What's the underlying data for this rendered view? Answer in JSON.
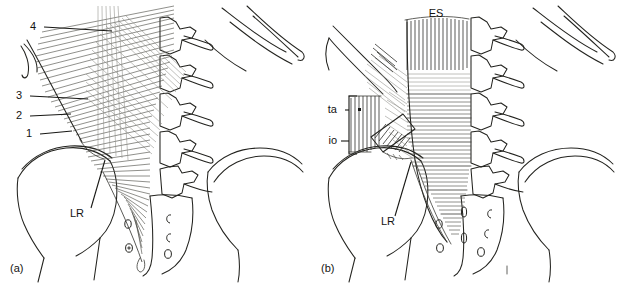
{
  "figure": {
    "background_color": "#ffffff",
    "ink_color": "#23231f",
    "width": 622,
    "height": 284
  },
  "panels": [
    {
      "id": "a",
      "caption": "(a)",
      "caption_x": 10,
      "caption_y": 272,
      "description": "Posterior layer of thoracolumbar fascia with obliquely oriented fibre bands",
      "labels": [
        {
          "key": "layer4",
          "text": "4",
          "text_x": 36,
          "text_y": 27,
          "leader": "M 44 27 L 112 31",
          "meaning": "fibre-band-4"
        },
        {
          "key": "layer3",
          "text": "3",
          "text_x": 22,
          "text_y": 96,
          "leader": "M 30 96 L 88 99",
          "meaning": "fibre-band-3"
        },
        {
          "key": "layer2",
          "text": "2",
          "text_x": 22,
          "text_y": 116,
          "leader": "M 30 116 L 71 114",
          "meaning": "fibre-band-2"
        },
        {
          "key": "layer1",
          "text": "1",
          "text_x": 32,
          "text_y": 134,
          "leader": "M 40 134 L 72 131",
          "meaning": "fibre-band-1"
        },
        {
          "key": "lateral_raphe",
          "text": "LR",
          "text_x": 77,
          "text_y": 214,
          "leader": "M 91 208 L 105 160",
          "meaning": "lateral-raphe"
        }
      ]
    },
    {
      "id": "b",
      "caption": "(b)",
      "caption_x": 321,
      "caption_y": 272,
      "description": "Deep layer showing erector spinae, transversus abdominis and internal oblique attachments",
      "labels": [
        {
          "key": "erector_spinae",
          "text": "ES",
          "text_x": 436,
          "text_y": 14,
          "leader": "",
          "meaning": "erector-spinae"
        },
        {
          "key": "transversus_abdominis",
          "text": "ta",
          "text_x": 333,
          "text_y": 110,
          "leader": "M 345 110 L 361 110",
          "meaning": "transversus-abdominis"
        },
        {
          "key": "internal_oblique",
          "text": "io",
          "text_x": 333,
          "text_y": 141,
          "leader": "M 344 141 L 361 141",
          "meaning": "internal-oblique"
        },
        {
          "key": "lateral_raphe",
          "text": "LR",
          "text_x": 388,
          "text_y": 222,
          "leader": "M 402 216 L 418 162",
          "meaning": "lateral-raphe"
        }
      ],
      "bracket": {
        "meaning": "ta-io-bracket",
        "path": "M 369 96 L 361 96 L 361 154 L 369 154"
      }
    }
  ],
  "legend_keys": {
    "ES": "erector spinae",
    "ta": "transversus abdominis",
    "io": "internal oblique",
    "LR": "lateral raphe",
    "1": "fibre band 1",
    "2": "fibre band 2",
    "3": "fibre band 3",
    "4": "fibre band 4"
  }
}
